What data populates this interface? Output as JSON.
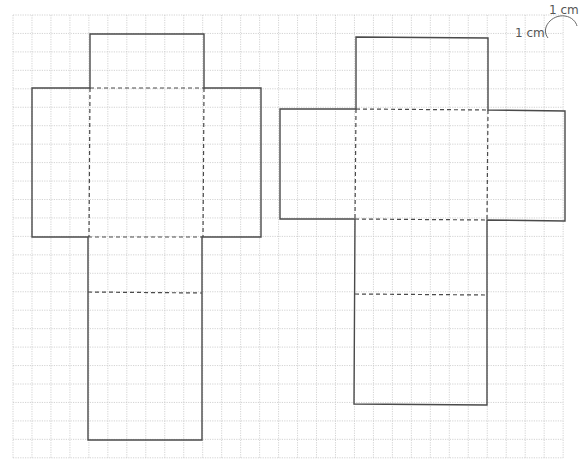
{
  "diagram": {
    "type": "net-on-grid",
    "grid": {
      "origin_x": 13,
      "origin_y": 15,
      "cell_w": 18.97,
      "cell_h": 18.45,
      "cols": 29,
      "rows": 24,
      "color": "#c8c8c8"
    },
    "scale": {
      "horizontal_label": "1 cm",
      "vertical_label": "1 cm"
    },
    "colors": {
      "outline": "#4a4a4a",
      "fold": "#4a4a4a",
      "label": "#555555"
    },
    "nets": [
      {
        "name": "net-a",
        "cells": {
          "col": 4,
          "row": 1,
          "wing_width": 3,
          "body_width": 6,
          "top_flap": 3,
          "middle": 8,
          "lower_flap": 3,
          "bottom_face": 8
        },
        "dimensions_cm": {
          "length": 6,
          "width": 3,
          "height": 8
        }
      },
      {
        "name": "net-b",
        "cells": {
          "col": 18,
          "row": 1,
          "wing_width": 4,
          "body_width": 7,
          "top_flap": 4,
          "middle": 6,
          "lower_flap": 4,
          "bottom_face": 6
        },
        "dimensions_cm": {
          "length": 7,
          "width": 4,
          "height": 6
        }
      }
    ]
  }
}
